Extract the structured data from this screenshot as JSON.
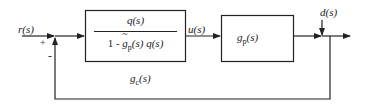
{
  "diagram": {
    "type": "block-diagram",
    "title": "",
    "signals": {
      "reference": "r(s)",
      "control": "u(s)",
      "disturbance": "d(s)"
    },
    "summing_junction": {
      "signs": {
        "input": "+",
        "feedback": "-"
      }
    },
    "blocks": {
      "controller_inner": {
        "numerator": "q(s)",
        "denominator_prefix": "1 - ",
        "denominator_g": "g",
        "denominator_g_sub": "p",
        "denominator_suffix": "(s) q(s)"
      },
      "controller_label": {
        "main": "g",
        "sub": "c",
        "arg": "(s)"
      },
      "plant": {
        "main": "g",
        "sub": "p",
        "arg": "(s)"
      }
    },
    "colors": {
      "line": "#222222",
      "background": "#ffffff"
    }
  }
}
